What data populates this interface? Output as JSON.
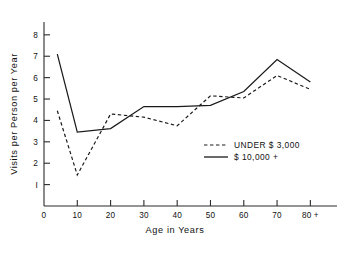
{
  "chart_data": {
    "type": "line",
    "title": "",
    "xlabel": "Age in Years",
    "ylabel": "Visits per Person per Year",
    "xlim": [
      0,
      88
    ],
    "ylim": [
      0,
      8.6
    ],
    "grid": false,
    "legend_position": "inside-right",
    "x_tick_labels": [
      "0",
      "10",
      "20",
      "30",
      "40",
      "50",
      "60",
      "70",
      "80 +"
    ],
    "x_ticks": [
      0,
      10,
      20,
      30,
      40,
      50,
      60,
      70,
      80
    ],
    "y_tick_labels": [
      "I",
      "2",
      "3",
      "4",
      "5",
      "6",
      "7",
      "8"
    ],
    "y_ticks": [
      1,
      2,
      3,
      4,
      5,
      6,
      7,
      8
    ],
    "x": [
      4,
      10,
      20,
      30,
      40,
      50,
      60,
      70,
      80
    ],
    "series": [
      {
        "name": "UNDER $ 3,000",
        "style": "dashed",
        "values": [
          4.45,
          1.45,
          4.3,
          4.15,
          3.75,
          5.15,
          5.05,
          6.1,
          5.45
        ]
      },
      {
        "name": "$ 10,000 +",
        "style": "solid",
        "values": [
          7.1,
          3.45,
          3.62,
          4.65,
          4.65,
          4.7,
          5.35,
          6.85,
          5.8
        ]
      }
    ]
  },
  "legend": {
    "entries": [
      {
        "label": "UNDER $ 3,000",
        "style": "dashed"
      },
      {
        "label": "$ 10,000 +",
        "style": "solid"
      }
    ]
  }
}
